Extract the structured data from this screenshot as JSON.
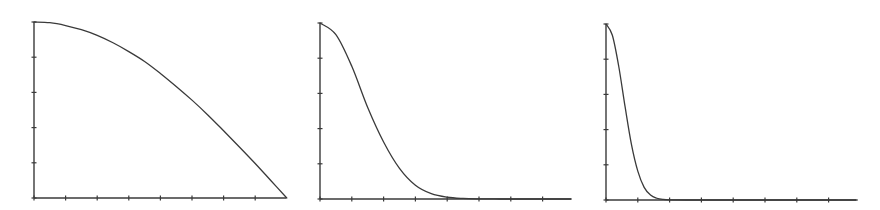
{
  "chart_data": [
    {
      "type": "line",
      "title": "",
      "xlabel": "",
      "ylabel": "",
      "xlim": [
        0,
        8
      ],
      "ylim": [
        0,
        5
      ],
      "x_ticks": [
        0,
        1,
        2,
        3,
        4,
        5,
        6,
        7,
        8
      ],
      "y_ticks": [
        0,
        1,
        2,
        3,
        4,
        5
      ],
      "grid": false,
      "legend": null,
      "description": "Concave decreasing curve (cosine quarter-wave) from 5 at x=0 to 0 at x=8",
      "series": [
        {
          "name": "curve",
          "x": [
            0,
            0.5,
            1,
            1.5,
            2,
            2.5,
            3,
            3.5,
            4,
            4.5,
            5,
            5.5,
            6,
            6.5,
            7,
            7.5,
            8
          ],
          "y": [
            5.0,
            4.98,
            4.9,
            4.78,
            4.62,
            4.41,
            4.16,
            3.88,
            3.54,
            3.17,
            2.78,
            2.36,
            1.91,
            1.45,
            0.98,
            0.49,
            0.0
          ]
        }
      ]
    },
    {
      "type": "line",
      "title": "",
      "xlabel": "",
      "ylabel": "",
      "xlim": [
        0,
        7.9
      ],
      "ylim": [
        0,
        5
      ],
      "x_ticks": [
        0,
        1,
        2,
        3,
        4,
        5,
        6,
        7
      ],
      "y_ticks": [
        0,
        1,
        2,
        3,
        4,
        5
      ],
      "grid": false,
      "legend": null,
      "description": "Gaussian-like decay from 5 at x=0, half height near x≈1.55, ~0 by x≈6",
      "series": [
        {
          "name": "curve",
          "x": [
            0,
            0.5,
            1,
            1.5,
            2,
            2.5,
            3,
            3.5,
            4,
            4.5,
            5,
            5.5,
            6,
            7,
            7.9
          ],
          "y": [
            5.0,
            4.67,
            3.77,
            2.6,
            1.62,
            0.87,
            0.39,
            0.15,
            0.05,
            0.015,
            0.004,
            0.001,
            0.0,
            0.0,
            0.0
          ]
        }
      ]
    },
    {
      "type": "line",
      "title": "",
      "xlabel": "",
      "ylabel": "",
      "xlim": [
        0,
        7.9
      ],
      "ylim": [
        0,
        5
      ],
      "x_ticks": [
        0,
        1,
        2,
        3,
        4,
        5,
        6,
        7
      ],
      "y_ticks": [
        0,
        1,
        2,
        3,
        4,
        5
      ],
      "grid": false,
      "legend": null,
      "description": "Narrow Gaussian-like decay from 5 at x=0, half height near x≈0.62, ~0 by x≈2",
      "series": [
        {
          "name": "curve",
          "x": [
            0,
            0.2,
            0.4,
            0.6,
            0.8,
            1.0,
            1.2,
            1.4,
            1.6,
            1.8,
            2.0,
            2.5,
            3,
            4,
            5,
            6,
            7,
            7.9
          ],
          "y": [
            5.0,
            4.68,
            3.8,
            2.65,
            1.58,
            0.82,
            0.36,
            0.14,
            0.05,
            0.015,
            0.004,
            0.0,
            0.0,
            0.0,
            0.0,
            0.0,
            0.0,
            0.0
          ]
        }
      ]
    }
  ],
  "panels": [
    {
      "origin_px": [
        34,
        198
      ],
      "x_unit_px": 31.6,
      "y_unit_px": 35.2,
      "x_axis_end_px": 286,
      "y_axis_top_px": 22
    },
    {
      "origin_px": [
        320,
        199
      ],
      "x_unit_px": 31.8,
      "y_unit_px": 35.2,
      "x_axis_end_px": 571,
      "y_axis_top_px": 23
    },
    {
      "origin_px": [
        606,
        200
      ],
      "x_unit_px": 31.8,
      "y_unit_px": 35.2,
      "x_axis_end_px": 856,
      "y_axis_top_px": 24
    }
  ],
  "style": {
    "line_color": "#3a3a3a",
    "axis_color": "#3a3a3a",
    "background": "#ffffff"
  }
}
